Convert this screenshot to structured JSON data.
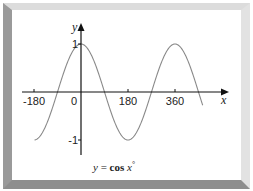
{
  "chart_data": {
    "type": "line",
    "title": "y = cos x°",
    "title_parts": {
      "lhs": "y",
      "eq": " = ",
      "fn": "cos",
      "var": "x",
      "deg": "°"
    },
    "xlabel": "x",
    "ylabel": "y",
    "x_ticks": [
      {
        "value": -180,
        "label": "-180"
      },
      {
        "value": 0,
        "label": "0"
      },
      {
        "value": 180,
        "label": "180"
      },
      {
        "value": 360,
        "label": "360"
      }
    ],
    "y_ticks": [
      {
        "value": 1,
        "label": "1"
      },
      {
        "value": -1,
        "label": "-1"
      }
    ],
    "xlim": [
      -180,
      467
    ],
    "ylim": [
      -1,
      1
    ],
    "series": [
      {
        "name": "cos x",
        "function": "cos",
        "x_start": -178,
        "x_end": 467,
        "color": "#8a8a8a"
      }
    ],
    "sample_points": [
      {
        "x": -180,
        "y": -1
      },
      {
        "x": -90,
        "y": 0
      },
      {
        "x": 0,
        "y": 1
      },
      {
        "x": 90,
        "y": 0
      },
      {
        "x": 180,
        "y": -1
      },
      {
        "x": 270,
        "y": 0
      },
      {
        "x": 360,
        "y": 1
      },
      {
        "x": 450,
        "y": 0
      }
    ],
    "grid": false,
    "legend": null
  },
  "colors": {
    "axis": "#111111",
    "curve": "#8a8a8a",
    "frame_top": "#dcdcdc",
    "frame_left": "#9a9a9a",
    "frame_right": "#e2e2e2",
    "frame_bottom": "#8e8e8e"
  }
}
